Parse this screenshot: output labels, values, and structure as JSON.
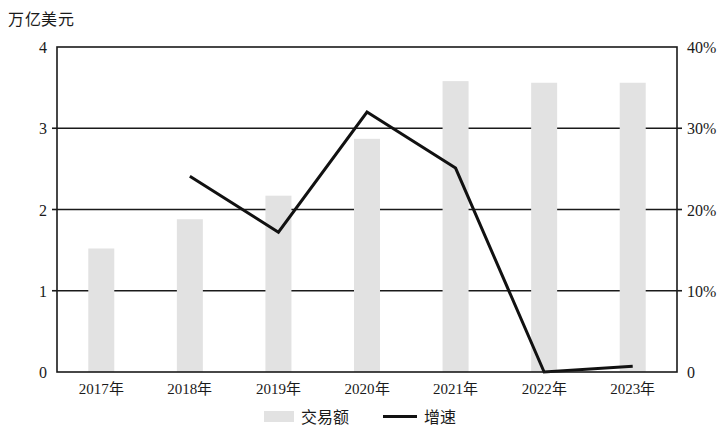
{
  "chart_data": {
    "type": "bar",
    "title": "",
    "ylabel": "万亿美元",
    "y2label": "",
    "xlabel": "",
    "categories": [
      "2017年",
      "2018年",
      "2019年",
      "2020年",
      "2021年",
      "2022年",
      "2023年"
    ],
    "ylim": [
      0,
      4
    ],
    "y2lim": [
      0,
      40
    ],
    "yticks": [
      "0",
      "1",
      "2",
      "3",
      "4"
    ],
    "ytick_values": [
      0,
      1,
      2,
      3,
      4
    ],
    "y2ticks": [
      "0",
      "10%",
      "20%",
      "30%",
      "40%"
    ],
    "y2tick_values": [
      0,
      10,
      20,
      30,
      40
    ],
    "grid": true,
    "legend_position": "bottom",
    "series": [
      {
        "name": "交易额",
        "type": "bar",
        "axis": "left",
        "unit": "万亿美元",
        "color": "#e2e2e2",
        "values": [
          1.52,
          1.88,
          2.17,
          2.87,
          3.58,
          3.56,
          3.56
        ]
      },
      {
        "name": "增速",
        "type": "line",
        "axis": "right",
        "unit": "%",
        "color": "#111111",
        "values": [
          null,
          24.1,
          17.2,
          32.0,
          25.1,
          0.0,
          0.7
        ]
      }
    ]
  },
  "legend": {
    "items": [
      {
        "label": "交易额",
        "marker": "bar-swatch"
      },
      {
        "label": "增速",
        "marker": "line-swatch"
      }
    ]
  }
}
